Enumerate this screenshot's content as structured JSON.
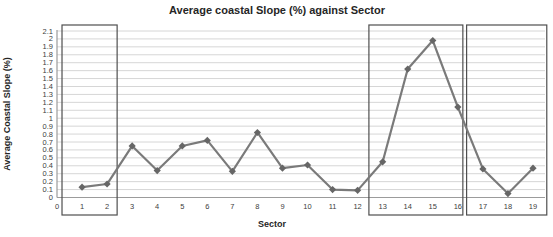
{
  "chart_data": {
    "type": "line",
    "title": "Average coastal Slope (%) against Sector",
    "xlabel": "Sector",
    "ylabel": "Average Coastal Slope (%)",
    "x": [
      1,
      2,
      3,
      4,
      5,
      6,
      7,
      8,
      9,
      10,
      11,
      12,
      13,
      14,
      15,
      16,
      17,
      18,
      19
    ],
    "values": [
      0.13,
      0.17,
      0.65,
      0.34,
      0.65,
      0.72,
      0.33,
      0.82,
      0.37,
      0.41,
      0.1,
      0.09,
      0.45,
      1.62,
      1.98,
      1.14,
      0.36,
      0.05,
      0.37
    ],
    "xticks": [
      "0",
      "1",
      "2",
      "3",
      "4",
      "5",
      "6",
      "7",
      "8",
      "9",
      "10",
      "11",
      "12",
      "13",
      "14",
      "15",
      "16",
      "17",
      "18",
      "19"
    ],
    "yticks": [
      "0",
      "0.1",
      "0.2",
      "0.3",
      "0.4",
      "0.5",
      "0.6",
      "0.7",
      "0.8",
      "0.9",
      "1",
      "1.1",
      "1.2",
      "1.3",
      "1.4",
      "1.5",
      "1.6",
      "1.7",
      "1.8",
      "1.9",
      "2",
      "2.1"
    ],
    "xlim": [
      0,
      19
    ],
    "ylim": [
      0,
      2.1
    ],
    "grid": "horizontal-only",
    "legend": "none",
    "marker_shape": "diamond",
    "annotation_boxes": [
      {
        "x_from": 0.2,
        "x_to": 2.4
      },
      {
        "x_from": 12.45,
        "x_to": 16.2
      },
      {
        "x_from": 16.35,
        "x_to": 19.55
      }
    ],
    "colors": {
      "line": "#7a7a7a",
      "marker": "#666666",
      "gridline": "#d6d6d6",
      "axis_line": "#9b9b9b",
      "box_border": "#4f4f4f",
      "title_text": "#262626",
      "tick_text": "#404040",
      "background": "#ffffff"
    }
  }
}
